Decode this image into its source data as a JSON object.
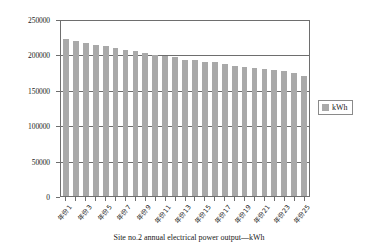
{
  "chart_data": {
    "type": "bar",
    "title": "",
    "xlabel": "Site no.2 annual electrical power output—kWh",
    "ylabel": "",
    "ylim": [
      0,
      250000
    ],
    "ytick_labels": [
      "0",
      "50000",
      "100000",
      "150000",
      "200000",
      "250000"
    ],
    "ytick_values": [
      0,
      50000,
      100000,
      150000,
      200000,
      250000
    ],
    "grid": true,
    "legend_position": "right",
    "legend": [
      "kWh"
    ],
    "series_color": "#a9a9a9",
    "categories": [
      "年份1",
      "年份2",
      "年份3",
      "年份4",
      "年份5",
      "年份6",
      "年份7",
      "年份8",
      "年份9",
      "年份10",
      "年份11",
      "年份12",
      "年份13",
      "年份14",
      "年份15",
      "年份16",
      "年份17",
      "年份18",
      "年份19",
      "年份20",
      "年份21",
      "年份22",
      "年份23",
      "年份24",
      "年份25"
    ],
    "tick_label_visible": [
      true,
      false,
      true,
      false,
      true,
      false,
      true,
      false,
      true,
      false,
      true,
      false,
      true,
      false,
      true,
      false,
      true,
      false,
      true,
      false,
      true,
      false,
      true,
      false,
      true
    ],
    "series": [
      {
        "name": "kWh",
        "values": [
          224000,
          221000,
          219000,
          216000,
          214000,
          211000,
          209000,
          207000,
          205000,
          201000,
          200000,
          198000,
          195000,
          194000,
          192000,
          191000,
          188000,
          186000,
          184000,
          183000,
          181000,
          180000,
          178000,
          176000,
          172000
        ]
      }
    ]
  },
  "axis_title": "Site no.2 annual electrical power output—kWh",
  "legend": {
    "label": "kWh"
  }
}
